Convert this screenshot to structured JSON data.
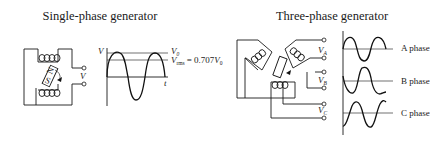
{
  "figure": {
    "single_phase": {
      "title": "Single-phase generator",
      "output_label": "V",
      "plot": {
        "y_axis_label": "V",
        "x_axis_label": "t",
        "peak_label": "V",
        "peak_sub": "0",
        "rms_label": "V",
        "rms_sub": "rms",
        "rms_eq": "= 0.707",
        "rms_eq_var": "V",
        "rms_eq_sub": "0"
      }
    },
    "three_phase": {
      "title": "Three-phase generator",
      "terminal_labels": [
        {
          "label": "V",
          "sub": "A"
        },
        {
          "label": "V",
          "sub": "B"
        },
        {
          "label": "V",
          "sub": "C"
        }
      ],
      "phases": [
        {
          "label": "A phase"
        },
        {
          "label": "B phase"
        },
        {
          "label": "C phase"
        }
      ]
    }
  }
}
